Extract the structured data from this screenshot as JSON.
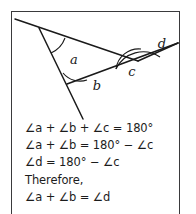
{
  "figure": {
    "angle_labels": [
      {
        "name": "a",
        "text": "a",
        "x": 62,
        "y": 52
      },
      {
        "name": "b",
        "text": "b",
        "x": 85,
        "y": 78
      },
      {
        "name": "c",
        "text": "c",
        "x": 122,
        "y": 64
      },
      {
        "name": "d",
        "text": "d",
        "x": 151,
        "y": 38
      }
    ],
    "stroke_color": "#1a1a1a",
    "border_color": "#3a3a3c",
    "background_color": "#ffffff"
  },
  "proof": {
    "lines": [
      "∠a + ∠b + ∠c = 180°",
      "∠a + ∠b = 180° − ∠c",
      "∠d = 180° − ∠c",
      "Therefore,",
      "∠a + ∠b = ∠d"
    ]
  }
}
